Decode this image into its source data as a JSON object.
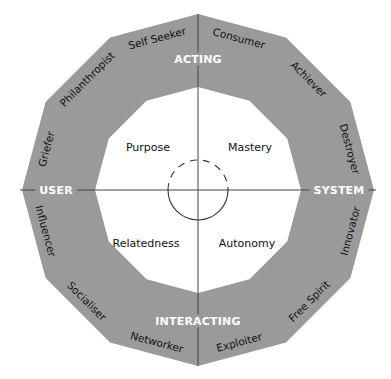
{
  "diagram": {
    "title": "",
    "colors": {
      "ring": "#9a9a9a",
      "lines": "#444444",
      "axis_text": "#ffffff",
      "text": "#111111",
      "background": "#ffffff"
    },
    "axes": {
      "top": "ACTING",
      "bottom": "INTERACTING",
      "left": "USER",
      "right": "SYSTEM"
    },
    "quadrants": {
      "top_left": "Purpose",
      "top_right": "Mastery",
      "bottom_left": "Relatedness",
      "bottom_right": "Autonomy"
    },
    "segments": [
      "Consumer",
      "Achiever",
      "Destroyer",
      "Innovator",
      "Free Spirit",
      "Exploiter",
      "Networker",
      "Socialiser",
      "Influencer",
      "Griefer",
      "Philanthropist",
      "Self Seeker"
    ]
  }
}
